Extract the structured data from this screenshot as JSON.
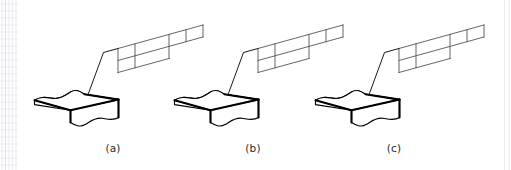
{
  "figure": {
    "background_color": "#ffffff",
    "ink_color": "#000000",
    "mesh_color": "#4a4a50",
    "watermark_color": "#e9e9ef",
    "caption_color": "#2b2b2b",
    "panels": [
      {
        "id": "panel-a",
        "caption": "(a)",
        "caption_x": 113,
        "caption_y": 152,
        "origin_x": 0,
        "specimen_name": "slab-specimen",
        "callout_name": "mesh-detail-grid",
        "mesh_columns": 4,
        "mesh_rows": 2,
        "leader_name": "leader-arrow"
      },
      {
        "id": "panel-b",
        "caption": "(b)",
        "caption_x": 253,
        "caption_y": 152,
        "origin_x": 140,
        "specimen_name": "slab-specimen",
        "callout_name": "mesh-detail-grid",
        "mesh_columns": 4,
        "mesh_rows": 2,
        "leader_name": "leader-arrow"
      },
      {
        "id": "panel-c",
        "caption": "(c)",
        "caption_x": 394,
        "caption_y": 152,
        "origin_x": 281,
        "specimen_name": "slab-specimen",
        "callout_name": "mesh-detail-grid",
        "mesh_columns": 4,
        "mesh_rows": 2,
        "leader_name": "leader-arrow"
      }
    ],
    "captions": {
      "a": "(a)",
      "b": "(b)",
      "c": "(c)"
    }
  }
}
